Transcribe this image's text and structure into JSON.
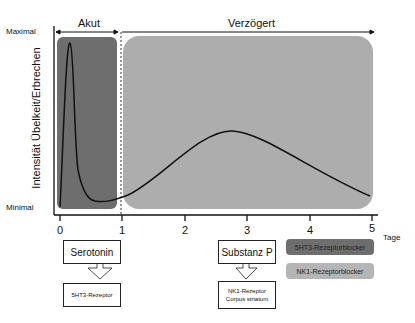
{
  "diagram": {
    "y_axis": {
      "label": "Intensität Übelkeit/Erbrechen",
      "top_label": "Maximal",
      "bottom_label": "Minimal"
    },
    "x_axis": {
      "unit_label": "Tage",
      "ticks": [
        "0",
        "1",
        "2",
        "3",
        "4",
        "5"
      ]
    },
    "phases": [
      {
        "label": "Akut",
        "range": [
          0,
          1
        ],
        "color": "#6e6e6e"
      },
      {
        "label": "Verzögert",
        "range": [
          1,
          5
        ],
        "color": "#adadad"
      }
    ],
    "mediators": [
      {
        "label": "Serotonin",
        "receptor": "5HT3-Rezeptor"
      },
      {
        "label": "Substanz P",
        "receptor_line1": "NK1-Rezeptor",
        "receptor_line2": "Corpus striatum"
      }
    ],
    "legend": [
      {
        "label": "5HT3-Rezeptorblocker",
        "color": "#6e6e6e"
      },
      {
        "label": "NK1-Rezeptorblocker",
        "color": "#b5b5b5"
      }
    ]
  }
}
